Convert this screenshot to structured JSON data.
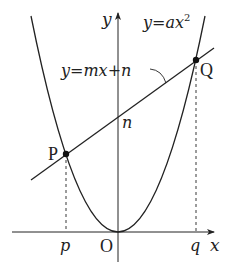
{
  "diagram": {
    "type": "function-graph",
    "axes": {
      "x_label": "x",
      "y_label": "y",
      "origin_label": "O"
    },
    "curves": [
      {
        "name": "parabola",
        "label": "y=ax²",
        "label_base": "y=ax",
        "label_sup": "2"
      },
      {
        "name": "line",
        "label": "y=mx+n"
      }
    ],
    "points": [
      {
        "name": "P",
        "label": "P",
        "x_label": "p"
      },
      {
        "name": "Q",
        "label": "Q",
        "x_label": "q"
      }
    ],
    "intercept_label": "n",
    "colors": {
      "stroke": "#222222",
      "background": "#ffffff"
    }
  }
}
